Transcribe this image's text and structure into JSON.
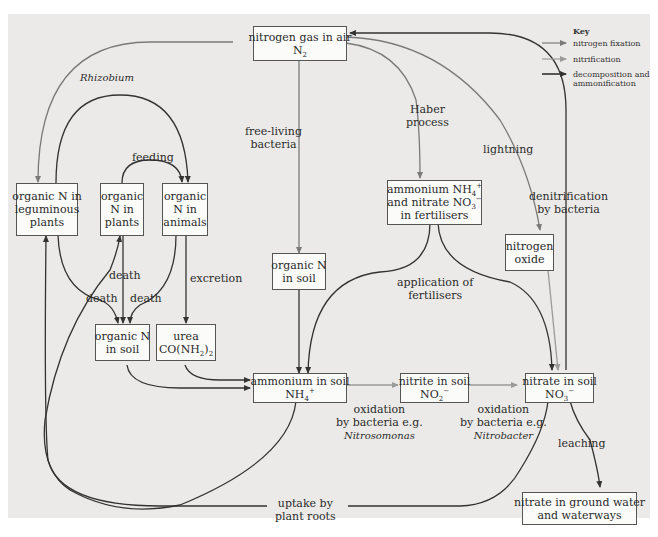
{
  "colors": {
    "panel": "#eceae8",
    "box_fill": "#fbfbfa",
    "nitrogen_fixation": "#7a7a7a",
    "nitrification": "#9a9a9a",
    "decomposition": "#333333"
  },
  "key": {
    "title": "Key",
    "items": [
      {
        "label": "nitrogen fixation",
        "style": "gray arrow"
      },
      {
        "label": "nitrification",
        "style": "light gray arrow"
      },
      {
        "label": "decomposition and",
        "label2": "ammonification",
        "style": "dark arrow"
      }
    ]
  },
  "nodes": {
    "n2": {
      "line1": "nitrogen gas in air",
      "line2_main": "N",
      "line2_sub": "2"
    },
    "legume": {
      "line1": "organic N in",
      "line2": "leguminous",
      "line3": "plants"
    },
    "plants": {
      "line1": "organic",
      "line2": "N in",
      "line3": "plants"
    },
    "animals": {
      "line1": "organic",
      "line2": "N in",
      "line3": "animals"
    },
    "orgsoil_mid": {
      "line1": "organic N",
      "line2": "in soil"
    },
    "orgsoil_low": {
      "line1": "organic N",
      "line2": "in soil"
    },
    "urea": {
      "line1": "urea",
      "line2_a": "CO(NH",
      "line2_sub": "2",
      "line2_b": ")",
      "line2_sub2": "2"
    },
    "fert": {
      "line1_a": "ammonium NH",
      "line1_sub": "4",
      "line1_sup": "+",
      "line2_a": "and nitrate NO",
      "line2_sub": "3",
      "line2_sup": "−",
      "line3": "in fertilisers"
    },
    "nox": {
      "line1": "nitrogen",
      "line2": "oxide"
    },
    "ammonium": {
      "line1": "ammonium in soil",
      "line2_a": "NH",
      "line2_sub": "4",
      "line2_sup": "+"
    },
    "nitrite": {
      "line1": "nitrite in soil",
      "line2_a": "NO",
      "line2_sub": "2",
      "line2_sup": "−"
    },
    "nitrate": {
      "line1": "nitrate in soil",
      "line2_a": "NO",
      "line2_sub": "3",
      "line2_sup": "−"
    },
    "groundwater": {
      "line1": "nitrate in ground water",
      "line2": "and waterways"
    }
  },
  "labels": {
    "rhizobium": "Rhizobium",
    "feeding": "feeding",
    "free_living_1": "free-living",
    "free_living_2": "bacteria",
    "haber_1": "Haber",
    "haber_2": "process",
    "lightning": "lightning",
    "denit_1": "denitrification",
    "denit_2": "by bacteria",
    "death_center": "death",
    "death_left": "death",
    "death_right": "death",
    "excretion": "excretion",
    "application_1": "application of",
    "application_2": "fertilisers",
    "ox1_1": "oxidation",
    "ox1_2": "by bacteria e.g.",
    "ox1_3": "Nitrosomonas",
    "ox2_1": "oxidation",
    "ox2_2": "by bacteria e.g.",
    "ox2_3": "Nitrobacter",
    "leaching": "leaching",
    "uptake_1": "uptake by",
    "uptake_2": "plant roots"
  }
}
